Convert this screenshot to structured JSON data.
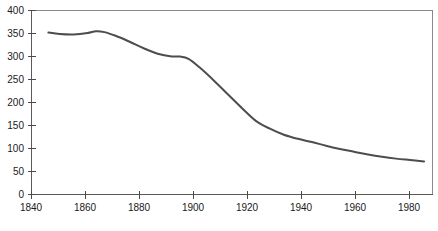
{
  "chart_data": {
    "type": "line",
    "title": "",
    "subtitle": "",
    "xlabel": "",
    "ylabel": "",
    "xlim": [
      1840,
      1983
    ],
    "ylim": [
      0,
      400
    ],
    "grid": false,
    "legend": false,
    "legend_position": "none",
    "line_color": "#4d4d4d",
    "axis_color": "#5a5a5a",
    "frame_color": "#8a8a8a",
    "x_ticks": [
      1840,
      1860,
      1880,
      1900,
      1920,
      1940,
      1960,
      1980
    ],
    "x_tick_labels": [
      "1840",
      "1860",
      "1880",
      "1900",
      "1920",
      "1940",
      "1960",
      "1980"
    ],
    "y_ticks": [
      0,
      50,
      100,
      150,
      200,
      250,
      300,
      350,
      400
    ],
    "y_tick_labels": [
      "0",
      "50",
      "100",
      "150",
      "200",
      "250",
      "300",
      "350",
      "400"
    ],
    "series": [
      {
        "name": "series-1",
        "x": [
          1846,
          1850,
          1855,
          1860,
          1863,
          1866,
          1870,
          1875,
          1880,
          1885,
          1890,
          1893,
          1896,
          1900,
          1905,
          1910,
          1915,
          1920,
          1925,
          1930,
          1935,
          1940,
          1945,
          1950,
          1955,
          1960,
          1965,
          1970,
          1975,
          1980
        ],
        "y": [
          352,
          349,
          348,
          351,
          355,
          353,
          345,
          332,
          318,
          306,
          300,
          300,
          295,
          276,
          248,
          218,
          188,
          160,
          143,
          130,
          121,
          114,
          106,
          99,
          93,
          87,
          82,
          78,
          75,
          72
        ]
      }
    ]
  },
  "axis": {
    "x_axis_name": "year-axis",
    "y_axis_name": "value-axis"
  }
}
